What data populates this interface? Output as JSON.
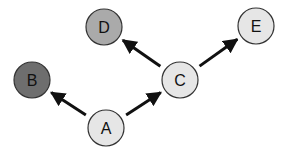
{
  "diagram": {
    "type": "directed-graph",
    "background": "#ffffff",
    "node_radius": 18,
    "stroke_color": "#333333",
    "nodes": [
      {
        "id": "A",
        "label": "A",
        "x": 106,
        "y": 128,
        "fill": "#e6e6e6"
      },
      {
        "id": "B",
        "label": "B",
        "x": 32,
        "y": 80,
        "fill": "#6e6e6e"
      },
      {
        "id": "C",
        "label": "C",
        "x": 180,
        "y": 80,
        "fill": "#e6e6e6"
      },
      {
        "id": "D",
        "label": "D",
        "x": 104,
        "y": 27,
        "fill": "#aaaaaa"
      },
      {
        "id": "E",
        "label": "E",
        "x": 256,
        "y": 26,
        "fill": "#e6e6e6"
      }
    ],
    "edges": [
      {
        "from": "A",
        "to": "B"
      },
      {
        "from": "A",
        "to": "C"
      },
      {
        "from": "C",
        "to": "D"
      },
      {
        "from": "C",
        "to": "E"
      }
    ]
  }
}
